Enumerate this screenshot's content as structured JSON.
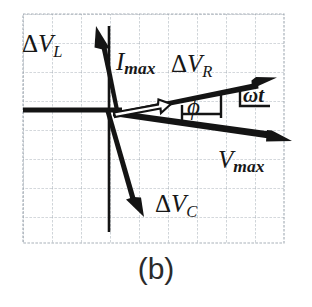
{
  "figure": {
    "caption": "(b)",
    "type": "phasor-diagram",
    "background_color": "#ffffff",
    "grid": {
      "line_color": "#9aa3ad",
      "cell_size_px": 29,
      "left": 23,
      "top": 14,
      "right": 284,
      "bottom": 243,
      "columns": 9,
      "rows": 8
    },
    "origin": {
      "x": 113,
      "y": 110
    },
    "ink_color": "#141414",
    "labels": {
      "delta_vl": {
        "delta": "Δ",
        "v": "V",
        "sub": "L"
      },
      "imax": {
        "v": "I",
        "sub": "max"
      },
      "delta_vr": {
        "delta": "Δ",
        "v": "V",
        "sub": "R"
      },
      "delta_vc": {
        "delta": "Δ",
        "v": "V",
        "sub": "C"
      },
      "vmax": {
        "v": "V",
        "sub": "max"
      },
      "omega_t": "ωt",
      "phi": "ϕ"
    },
    "vectors": [
      {
        "name": "delta-v-l",
        "label": "ΔV_L",
        "style": "solid-filled-arrow",
        "from": {
          "x": 113,
          "y": 110
        },
        "to": {
          "x": 96,
          "y": 28
        },
        "angle_deg": 101.7
      },
      {
        "name": "i-max",
        "label": "I_max",
        "style": "hollow-outline-arrow",
        "from": {
          "x": 113,
          "y": 110
        },
        "to": {
          "x": 172,
          "y": 98
        },
        "angle_deg": 11.5
      },
      {
        "name": "delta-v-r",
        "label": "ΔV_R",
        "style": "solid-filled-arrow",
        "from": {
          "x": 113,
          "y": 110
        },
        "to": {
          "x": 274,
          "y": 78
        },
        "angle_deg": 11.2
      },
      {
        "name": "v-max",
        "label": "V_max",
        "style": "solid-filled-arrow",
        "from": {
          "x": 113,
          "y": 110
        },
        "to": {
          "x": 290,
          "y": 141
        },
        "angle_deg": -9.9
      },
      {
        "name": "delta-v-c",
        "label": "ΔV_C",
        "style": "solid-filled-arrow",
        "from": {
          "x": 113,
          "y": 110
        },
        "to": {
          "x": 144,
          "y": 215
        },
        "angle_deg": -73.6
      }
    ],
    "axes": {
      "horizontal": {
        "from": {
          "x": 23,
          "y": 110
        },
        "to": {
          "x": 120,
          "y": 110
        }
      },
      "vertical": {
        "from": {
          "x": 109,
          "y": 26
        },
        "to": {
          "x": 109,
          "y": 232
        }
      }
    },
    "angle_markers": [
      {
        "name": "phi",
        "symbol": "ϕ",
        "between": [
          "v-max",
          "delta-v-r"
        ]
      },
      {
        "name": "omega-t",
        "symbol": "ωt",
        "between": [
          "horizontal-reference",
          "delta-v-r"
        ]
      }
    ]
  }
}
